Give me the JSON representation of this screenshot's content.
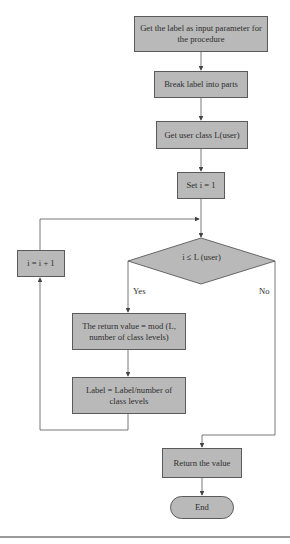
{
  "flowchart": {
    "nodes": {
      "start": "Get the label as input parameter for the procedure",
      "break": "Break label into parts",
      "get_class": "Get user class L(user)",
      "set_i": "Set i = 1",
      "decision": "i ≤ L (user)",
      "return_mod": "The return value = mod (L, number of class levels)",
      "label_div": "Label = Label/number of class levels",
      "increment": "i = i + 1",
      "return_value": "Return the value",
      "end": "End"
    },
    "edge_labels": {
      "yes": "Yes",
      "no": "No"
    },
    "colors": {
      "node_fill": "#b9b9b9",
      "node_border": "#5a5a5a",
      "line": "#555555",
      "text": "#2e2e2e"
    }
  }
}
